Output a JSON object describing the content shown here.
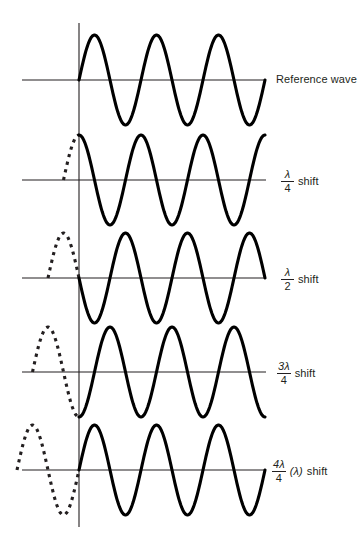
{
  "figure": {
    "type": "wave-phase-shift-diagram",
    "background_color": "#ffffff",
    "stroke_color": "#231f20",
    "axis_x_px": 79,
    "axis_top_px": 23,
    "axis_bottom_px": 527,
    "hline_start_px": 22,
    "hline_end_px": 266,
    "wavelength_px": 62,
    "amplitude_px": 45
  },
  "rows": [
    {
      "id": "reference",
      "baseline_y": 80,
      "phase_shift_fraction": 0,
      "phase_shift_text": "Reference wave",
      "label_kind": "plain",
      "label_text": "Reference wave",
      "label_y": 74,
      "dashed_lead_cycles": 0,
      "solid_cycles": 3,
      "start_value": 0,
      "start_direction": "rising"
    },
    {
      "id": "quarter",
      "baseline_y": 180,
      "phase_shift_fraction": 0.25,
      "phase_shift_text": "1/4 shift",
      "label_kind": "fraction",
      "numerator": "λ",
      "denominator": "4",
      "suffix": "shift",
      "paren": "",
      "label_y": 169,
      "dashed_lead_cycles": 0.25,
      "solid_cycles": 3,
      "start_value": 1,
      "start_direction": "peak"
    },
    {
      "id": "half",
      "baseline_y": 278,
      "phase_shift_fraction": 0.5,
      "phase_shift_text": "1/2 shift",
      "label_kind": "fraction",
      "numerator": "λ",
      "denominator": "2",
      "suffix": "shift",
      "paren": "",
      "label_y": 267,
      "dashed_lead_cycles": 0.5,
      "solid_cycles": 3,
      "start_value": 0,
      "start_direction": "falling"
    },
    {
      "id": "three-quarter",
      "baseline_y": 372,
      "phase_shift_fraction": 0.75,
      "phase_shift_text": "3/4 shift",
      "label_kind": "fraction",
      "numerator": "3λ",
      "denominator": "4",
      "suffix": "shift",
      "paren": "",
      "label_y": 361,
      "dashed_lead_cycles": 0.75,
      "solid_cycles": 3,
      "start_value": -1,
      "start_direction": "trough"
    },
    {
      "id": "full",
      "baseline_y": 470,
      "phase_shift_fraction": 1,
      "phase_shift_text": "4/4 (lambda) shift",
      "label_kind": "fraction",
      "numerator": "4λ",
      "denominator": "4",
      "suffix": "shift",
      "paren": "(λ)",
      "label_y": 459,
      "dashed_lead_cycles": 1,
      "solid_cycles": 3,
      "start_value": 0,
      "start_direction": "rising"
    }
  ],
  "labels": {
    "reference": "Reference wave",
    "shift_word": "shift",
    "lambda": "λ",
    "three_lambda": "3λ",
    "four_lambda": "4λ",
    "den_four": "4",
    "den_two": "2",
    "paren_lambda": "(λ)"
  }
}
